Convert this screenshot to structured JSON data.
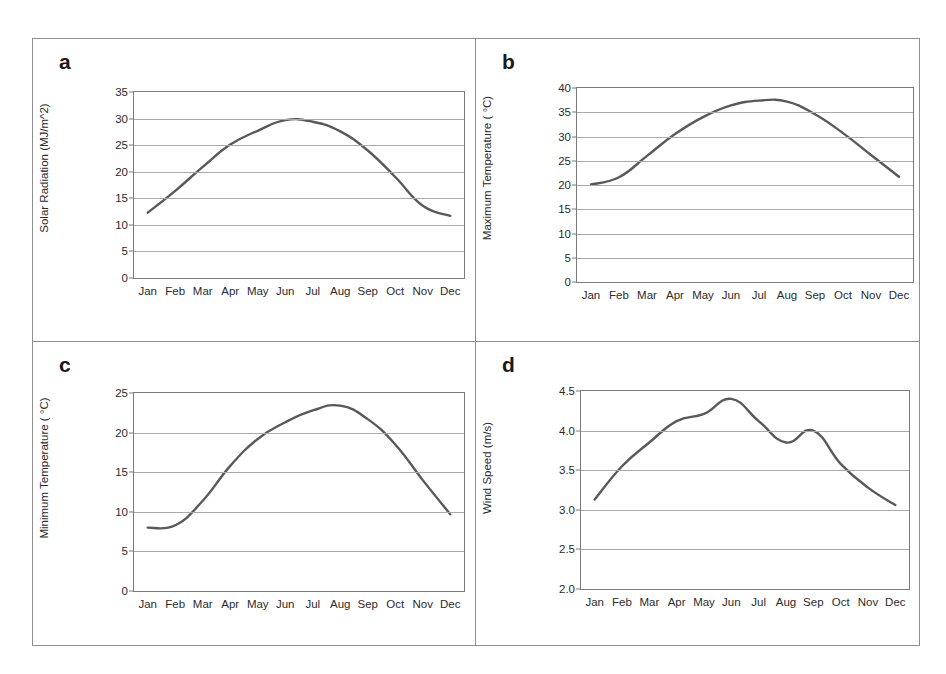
{
  "figure": {
    "panel_letters": [
      "a",
      "b",
      "c",
      "d"
    ],
    "axis_color": "#7b7b7b",
    "grid_color": "#a9a9a9",
    "series_color": "#595959",
    "frame_color": "#8f8f8f",
    "months": [
      "Jan",
      "Feb",
      "Mar",
      "Apr",
      "May",
      "Jun",
      "Jul",
      "Aug",
      "Sep",
      "Oct",
      "Nov",
      "Dec"
    ],
    "xlabel": "Month"
  },
  "chart_data": [
    {
      "panel": "a",
      "type": "line",
      "title": "",
      "xlabel": "Month",
      "ylabel": "Solar Radiation (MJ/m^2)",
      "categories": [
        "Jan",
        "Feb",
        "Mar",
        "Apr",
        "May",
        "Jun",
        "Jul",
        "Aug",
        "Sep",
        "Oct",
        "Nov",
        "Dec"
      ],
      "values": [
        12.3,
        16.4,
        20.9,
        25.1,
        27.7,
        29.7,
        29.4,
        27.6,
        24.0,
        19.0,
        13.6,
        11.7
      ],
      "ylim": [
        0,
        35
      ],
      "yticks": [
        0,
        5,
        10,
        15,
        20,
        25,
        30,
        35
      ],
      "ytick_labels": [
        "0",
        "5",
        "10",
        "15",
        "20",
        "25",
        "30",
        "35"
      ],
      "grid": true,
      "legend": "none"
    },
    {
      "panel": "b",
      "type": "line",
      "title": "",
      "xlabel": "Month",
      "ylabel": "Maximum Temperature ( °C)",
      "categories": [
        "Jan",
        "Feb",
        "Mar",
        "Apr",
        "May",
        "Jun",
        "Jul",
        "Aug",
        "Sep",
        "Oct",
        "Nov",
        "Dec"
      ],
      "values": [
        20.1,
        21.6,
        26.0,
        30.5,
        34.0,
        36.4,
        37.4,
        37.2,
        34.6,
        30.7,
        26.2,
        21.7
      ],
      "ylim": [
        0,
        40
      ],
      "yticks": [
        0,
        5,
        10,
        15,
        20,
        25,
        30,
        35,
        40
      ],
      "ytick_labels": [
        "0",
        "5",
        "10",
        "15",
        "20",
        "25",
        "30",
        "35",
        "40"
      ],
      "grid": true,
      "legend": "none"
    },
    {
      "panel": "c",
      "type": "line",
      "title": "",
      "xlabel": "Month",
      "ylabel": "Minimum Temperature ( °C)",
      "categories": [
        "Jan",
        "Feb",
        "Mar",
        "Apr",
        "May",
        "Jun",
        "Jul",
        "Aug",
        "Sep",
        "Oct",
        "Nov",
        "Dec"
      ],
      "values": [
        8.0,
        8.3,
        11.4,
        15.8,
        19.2,
        21.3,
        22.8,
        23.4,
        21.7,
        18.5,
        14.0,
        9.7
      ],
      "ylim": [
        0,
        25
      ],
      "yticks": [
        0,
        5,
        10,
        15,
        20,
        25
      ],
      "ytick_labels": [
        "0",
        "5",
        "10",
        "15",
        "20",
        "25"
      ],
      "grid": true,
      "legend": "none"
    },
    {
      "panel": "d",
      "type": "line",
      "title": "",
      "xlabel": "Month",
      "ylabel": "Wind Speed (m/s)",
      "categories": [
        "Jan",
        "Feb",
        "Mar",
        "Apr",
        "May",
        "Jun",
        "Jul",
        "Aug",
        "Sep",
        "Oct",
        "Nov",
        "Dec"
      ],
      "values": [
        3.13,
        3.55,
        3.85,
        4.12,
        4.21,
        4.4,
        4.12,
        3.85,
        4.0,
        3.58,
        3.28,
        3.06
      ],
      "ylim": [
        2.0,
        4.5
      ],
      "yticks": [
        2.0,
        2.5,
        3.0,
        3.5,
        4.0,
        4.5
      ],
      "ytick_labels": [
        "2.0",
        "2.5",
        "3.0",
        "3.5",
        "4.0",
        "4.5"
      ],
      "grid": true,
      "legend": "none"
    }
  ]
}
